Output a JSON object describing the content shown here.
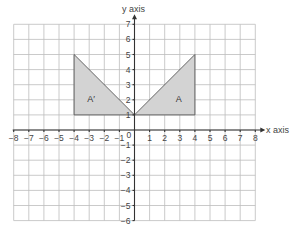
{
  "diagram": {
    "type": "coordinate-grid",
    "x_axis": {
      "label": "x axis",
      "min": -8,
      "max": 8,
      "ticks": [
        "-8",
        "-7",
        "-6",
        "-5",
        "-4",
        "-3",
        "-2",
        "-1",
        "1",
        "2",
        "3",
        "4",
        "5",
        "6",
        "7",
        "8"
      ]
    },
    "y_axis": {
      "label": "y axis",
      "min": -6,
      "max": 7,
      "ticks": [
        "7",
        "6",
        "5",
        "4",
        "3",
        "2",
        "1",
        "-1",
        "-2",
        "-3",
        "-4",
        "-5",
        "-6"
      ]
    },
    "origin_label": "0",
    "shapes": [
      {
        "name": "A",
        "label": "A",
        "vertices": [
          [
            0,
            1
          ],
          [
            4,
            1
          ],
          [
            4,
            5
          ]
        ],
        "fill": "#d3d3d3"
      },
      {
        "name": "A-prime",
        "label": "A′",
        "vertices": [
          [
            -4,
            5
          ],
          [
            -4,
            1
          ],
          [
            0,
            1
          ]
        ],
        "fill": "#d3d3d3"
      }
    ]
  }
}
